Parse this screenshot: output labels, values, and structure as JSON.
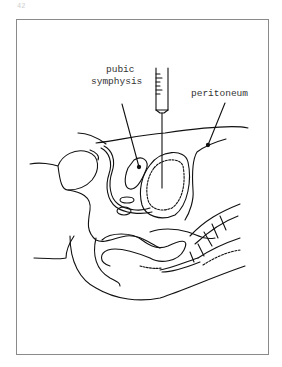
{
  "page": {
    "number": "42"
  },
  "figure": {
    "labels": {
      "pubic_line1": "pubic",
      "pubic_line2": "symphysis",
      "peritoneum": "peritoneum"
    }
  }
}
